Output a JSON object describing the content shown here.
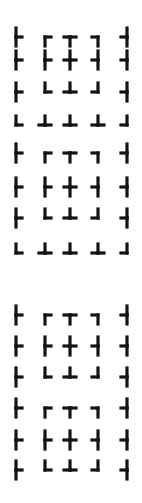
{
  "ink_color": "#141414",
  "background_color": "#ffffff",
  "column_x": [
    16,
    45,
    70,
    98,
    127
  ],
  "blocks": [
    {
      "name": "block-a",
      "rows": [
        {
          "y": 37,
          "short": false,
          "glyphs": [
            "├",
            "┌",
            "┬",
            "┐",
            "┤"
          ]
        },
        {
          "y": 60,
          "short": false,
          "glyphs": [
            "├",
            "├",
            "┼",
            "┤",
            "┤"
          ]
        },
        {
          "y": 92,
          "short": false,
          "glyphs": [
            "├",
            "└",
            "┴",
            "┘",
            "┤"
          ]
        },
        {
          "y": 120,
          "short": true,
          "glyphs": [
            "└",
            "┴",
            "┴",
            "┴",
            "┘"
          ]
        }
      ]
    },
    {
      "name": "block-b",
      "rows": [
        {
          "y": 153,
          "short": false,
          "glyphs": [
            "├",
            "┌",
            "┬",
            "┐",
            "┤"
          ]
        },
        {
          "y": 187,
          "short": false,
          "glyphs": [
            "├",
            "├",
            "┼",
            "┤",
            "┤"
          ]
        },
        {
          "y": 218,
          "short": false,
          "glyphs": [
            "├",
            "└",
            "┴",
            "┘",
            "┤"
          ]
        },
        {
          "y": 248,
          "short": true,
          "glyphs": [
            "└",
            "┴",
            "┴",
            "┴",
            "┘"
          ]
        }
      ]
    },
    {
      "name": "block-c",
      "rows": [
        {
          "y": 315,
          "short": false,
          "glyphs": [
            "├",
            "┌",
            "┬",
            "┐",
            "┤"
          ]
        },
        {
          "y": 346,
          "short": false,
          "glyphs": [
            "├",
            "├",
            "┼",
            "┤",
            "┤"
          ]
        },
        {
          "y": 377,
          "short": false,
          "glyphs": [
            "├",
            "└",
            "┴",
            "┘",
            "┤"
          ]
        },
        {
          "y": 408,
          "short": false,
          "glyphs": [
            "├",
            "┌",
            "┬",
            "┐",
            "┤"
          ]
        },
        {
          "y": 440,
          "short": false,
          "glyphs": [
            "├",
            "├",
            "┼",
            "┤",
            "┤"
          ]
        },
        {
          "y": 470,
          "short": false,
          "glyphs": [
            "├",
            "└",
            "┴",
            "┘",
            "┤"
          ]
        }
      ]
    }
  ]
}
